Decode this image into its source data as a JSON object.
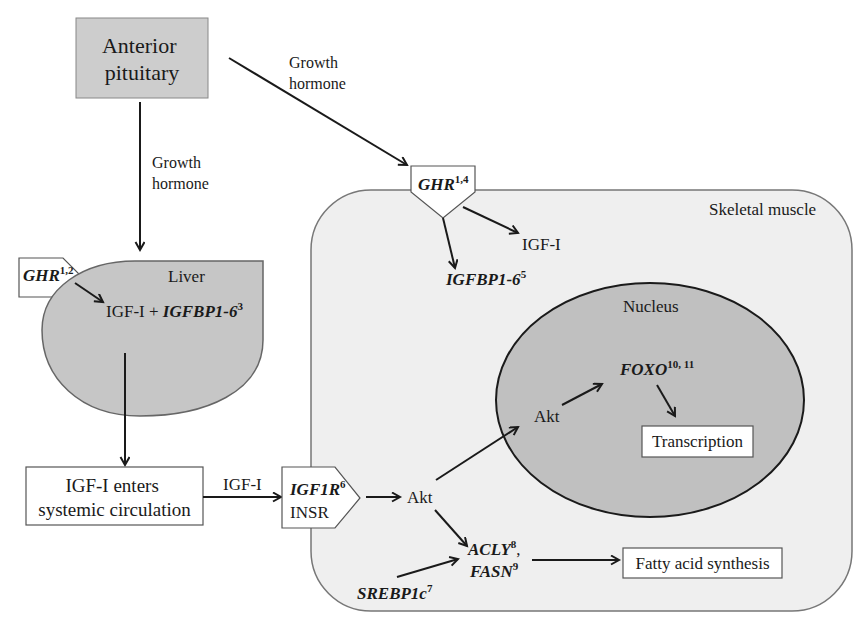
{
  "diagram": {
    "pituitary": {
      "line1": "Anterior",
      "line2": "pituitary"
    },
    "gh_label_to_liver": {
      "line1": "Growth",
      "line2": "hormone"
    },
    "gh_label_to_muscle": {
      "line1": "Growth",
      "line2": "hormone"
    },
    "liver": {
      "label": "Liver",
      "receptor": {
        "gene": "GHR",
        "ref": "1,2"
      },
      "product": {
        "prefix": "IGF-I + ",
        "gene": "IGFBP1-6",
        "ref": "3"
      }
    },
    "circulation": {
      "line1": "IGF-I enters",
      "line2": "systemic circulation"
    },
    "igf_arrow_label": "IGF-I",
    "insulin_receptor": {
      "gene": "IGF1R",
      "ref": "6",
      "line2": "INSR"
    },
    "muscle": {
      "label": "Skeletal muscle",
      "receptor": {
        "gene": "GHR",
        "ref": "1,4"
      },
      "igf": "IGF-I",
      "igfbp": {
        "gene": "IGFBP1-6",
        "ref": "5"
      },
      "akt": "Akt",
      "srebp": {
        "gene": "SREBP1c",
        "ref": "7"
      },
      "acly": {
        "gene": "ACLY",
        "ref": "8",
        "sep": ","
      },
      "fasn": {
        "gene": "FASN",
        "ref": "9"
      },
      "fatty_acid": "Fatty acid synthesis"
    },
    "nucleus": {
      "label": "Nucleus",
      "akt": "Akt",
      "foxo": {
        "gene": "FOXO",
        "ref": "10, 11"
      },
      "transcription": "Transcription"
    },
    "edges": [
      {
        "from": "Anterior pituitary",
        "to": "Liver GHR",
        "label": "Growth hormone"
      },
      {
        "from": "Anterior pituitary",
        "to": "Skeletal muscle GHR",
        "label": "Growth hormone"
      },
      {
        "from": "GHR (liver)",
        "to": "IGF-I + IGFBP1-6"
      },
      {
        "from": "Liver",
        "to": "IGF-I enters systemic circulation"
      },
      {
        "from": "IGF-I enters systemic circulation",
        "to": "IGF1R / INSR",
        "label": "IGF-I"
      },
      {
        "from": "IGF1R / INSR",
        "to": "Akt"
      },
      {
        "from": "GHR (muscle)",
        "to": "IGFBP1-6"
      },
      {
        "from": "GHR (muscle)",
        "to": "IGF-I"
      },
      {
        "from": "Akt",
        "to": "Akt (nucleus)"
      },
      {
        "from": "Akt",
        "to": "ACLY, FASN"
      },
      {
        "from": "SREBP1c",
        "to": "ACLY, FASN"
      },
      {
        "from": "ACLY, FASN",
        "to": "Fatty acid synthesis"
      },
      {
        "from": "Akt (nucleus)",
        "to": "FOXO"
      },
      {
        "from": "FOXO",
        "to": "Transcription"
      }
    ]
  },
  "colors": {
    "pituitary_fill": "#cdcdcd",
    "liver_fill": "#c6c6c6",
    "muscle_fill": "#efefef",
    "nucleus_fill": "#c0c0c0",
    "box_fill": "#ffffff",
    "ink": "#1a1a1a"
  }
}
